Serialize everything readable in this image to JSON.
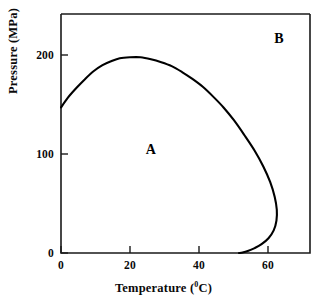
{
  "chart_data": {
    "type": "line",
    "title": "",
    "xlabel": "Temperature (⁰C)",
    "xlabel_text": "Temperature (",
    "xlabel_sup": "0",
    "xlabel_tail": "C)",
    "ylabel": "Pressure (MPa)",
    "xlim": [
      0,
      72
    ],
    "ylim": [
      0,
      243
    ],
    "xticks": [
      0,
      20,
      40,
      60
    ],
    "xtick_labels": [
      "0",
      "20",
      "40",
      "60"
    ],
    "yticks": [
      0,
      100,
      200
    ],
    "ytick_labels": [
      "0",
      "100",
      "200"
    ],
    "grid": false,
    "legend": "none",
    "series": [
      {
        "name": "phase boundary",
        "description": "Closed phase-boundary curve separating region A (inside, lower-left) from region B (outside, upper-right)",
        "color": "#000000",
        "points": [
          [
            0.0,
            148
          ],
          [
            2.0,
            158
          ],
          [
            4.5,
            168
          ],
          [
            7.0,
            177
          ],
          [
            9.5,
            185
          ],
          [
            12.0,
            191
          ],
          [
            14.5,
            195
          ],
          [
            17.0,
            198
          ],
          [
            20.0,
            199
          ],
          [
            23.0,
            199
          ],
          [
            26.0,
            197
          ],
          [
            29.0,
            194
          ],
          [
            32.0,
            190
          ],
          [
            35.0,
            184
          ],
          [
            38.0,
            177
          ],
          [
            41.0,
            169
          ],
          [
            44.0,
            159
          ],
          [
            47.0,
            148
          ],
          [
            50.0,
            135
          ],
          [
            53.0,
            120
          ],
          [
            56.0,
            104
          ],
          [
            58.5,
            88
          ],
          [
            60.5,
            72
          ],
          [
            61.8,
            57
          ],
          [
            62.4,
            44
          ],
          [
            62.3,
            33
          ],
          [
            61.5,
            23
          ],
          [
            60.0,
            15
          ],
          [
            58.0,
            9
          ],
          [
            56.0,
            5
          ],
          [
            54.0,
            2
          ],
          [
            52.5,
            0.5
          ],
          [
            51.5,
            0
          ]
        ]
      }
    ],
    "annotations": [
      {
        "text": "A",
        "x": 26,
        "y": 105,
        "name": "region-label-a"
      },
      {
        "text": "B",
        "x": 63,
        "y": 218,
        "name": "region-label-b"
      }
    ]
  }
}
